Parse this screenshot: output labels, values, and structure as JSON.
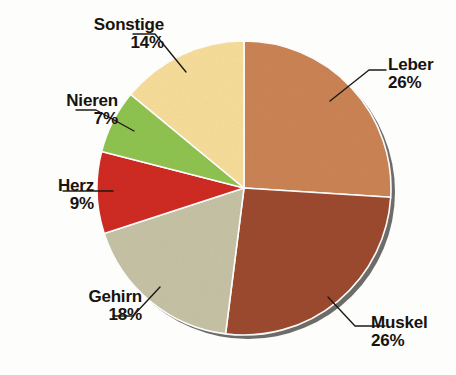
{
  "chart_data": {
    "type": "pie",
    "title": "",
    "subtitle": "",
    "xlabel": "",
    "ylabel": "",
    "legend_position": "callout-labels",
    "grid": false,
    "unit": "%",
    "start_angle_deg": 0,
    "direction": "clockwise",
    "categories": [
      "Leber",
      "Muskel",
      "Gehirn",
      "Herz",
      "Nieren",
      "Sonstige"
    ],
    "values": [
      26,
      26,
      18,
      9,
      7,
      14
    ],
    "slices": [
      {
        "id": "leber",
        "label": "Leber",
        "value": 26,
        "value_text": "26%",
        "color": "#cb8354",
        "label_align": "left",
        "leader_from": [
          330,
          101
        ],
        "leader_mid": [
          369,
          70
        ],
        "leader_to": [
          386,
          70
        ]
      },
      {
        "id": "muskel",
        "label": "Muskel",
        "value": 26,
        "value_text": "26%",
        "color": "#9c4a30",
        "label_align": "left",
        "leader_from": [
          328,
          297
        ],
        "leader_mid": [
          355,
          326
        ],
        "leader_to": [
          385,
          326
        ]
      },
      {
        "id": "gehirn",
        "label": "Gehirn",
        "value": 18,
        "value_text": "18%",
        "color": "#c6c2a5",
        "label_align": "right",
        "leader_from": [
          160,
          287
        ],
        "leader_mid": [
          133,
          316
        ],
        "leader_to": [
          113,
          316
        ]
      },
      {
        "id": "herz",
        "label": "Herz",
        "value": 9,
        "value_text": "9%",
        "color": "#cf2a24",
        "label_align": "right",
        "leader_from": [
          113,
          191
        ],
        "leader_mid": [
          95,
          191
        ],
        "leader_to": [
          63,
          191
        ]
      },
      {
        "id": "nieren",
        "label": "Nieren",
        "value": 7,
        "value_text": "7%",
        "color": "#8fc350",
        "label_align": "right",
        "leader_from": [
          134,
          131
        ],
        "leader_mid": [
          96,
          110
        ],
        "leader_to": [
          76,
          110
        ]
      },
      {
        "id": "sonstige",
        "label": "Sonstige",
        "value": 14,
        "value_text": "14%",
        "color": "#f7dd9a",
        "label_align": "right",
        "leader_from": [
          186,
          72
        ],
        "leader_mid": [
          155,
          34
        ],
        "leader_to": [
          133,
          34
        ]
      }
    ],
    "colors": {
      "leber": "#cb8354",
      "muskel": "#9c4a30",
      "gehirn": "#c6c2a5",
      "herz": "#cf2a24",
      "nieren": "#8fc350",
      "sonstige": "#f7dd9a",
      "slice_divider": "#ffffff",
      "pie_shadow": "#3a3a38",
      "label_text": "#17130f",
      "leader_line": "#1d1a16",
      "background": "#fdfdfb"
    },
    "geometry": {
      "center_x": 244,
      "center_y": 188,
      "radius": 147,
      "shadow_offset_x": 4,
      "shadow_offset_y": 4
    }
  }
}
